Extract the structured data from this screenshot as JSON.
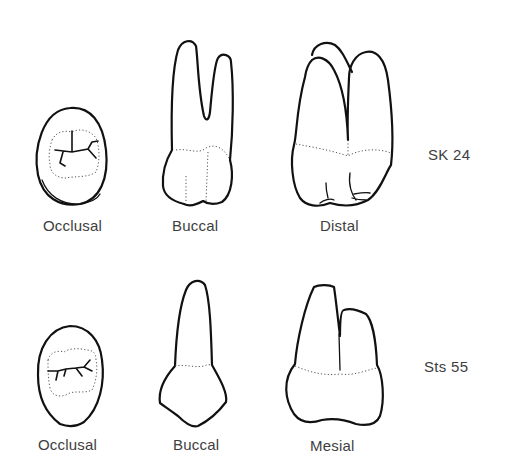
{
  "figure": {
    "rows": [
      {
        "specimen": "SK 24",
        "views": [
          {
            "label": "Occlusal"
          },
          {
            "label": "Buccal"
          },
          {
            "label": "Distal"
          }
        ]
      },
      {
        "specimen": "Sts 55",
        "views": [
          {
            "label": "Occlusal"
          },
          {
            "label": "Buccal"
          },
          {
            "label": "Mesial"
          }
        ]
      }
    ]
  },
  "colors": {
    "background": "#ffffff",
    "outline": "#111111",
    "text": "#3e3e3e"
  }
}
